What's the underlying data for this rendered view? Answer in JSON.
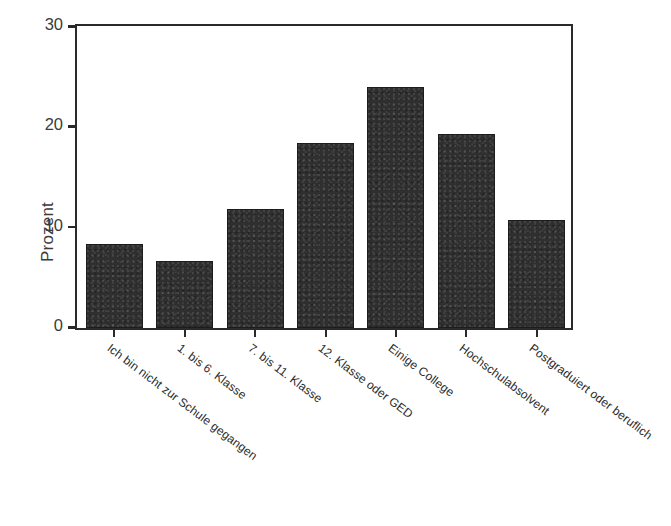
{
  "chart_data": {
    "type": "bar",
    "title": "",
    "subtitle": "",
    "xlabel": "",
    "ylabel": "Prozent",
    "ylim": [
      0,
      30
    ],
    "yticks": [
      0,
      10,
      20,
      30
    ],
    "ytick_labels": [
      "0",
      "10",
      "20",
      "30"
    ],
    "grid": false,
    "legend": false,
    "legend_position": "none",
    "bar_color": "#2f2f2f",
    "axis_color": "#2a2a2a",
    "background": "#ffffff",
    "label_rotation_degrees": 37,
    "categories": [
      "Ich bin nicht zur Schule gegangen",
      "1. bis 6. Klasse",
      "7. bis 11. Klasse",
      "12. Klasse oder GED",
      "Einige College",
      "Hochschulabsolvent",
      "Postgraduiert oder beruflich"
    ],
    "values": [
      8.4,
      6.7,
      11.9,
      18.4,
      24.0,
      19.3,
      10.8
    ]
  }
}
